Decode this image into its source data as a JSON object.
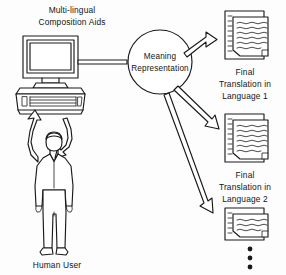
{
  "diagram": {
    "background_color": "#fdfdfd",
    "ink_color": "#1a1a1a"
  },
  "workstation": {
    "caption_line1": "Multi-lingual",
    "caption_line2": "Composition Aids",
    "icon_name": "desktop-computer-icon"
  },
  "user": {
    "caption": "Human User",
    "icon_name": "standing-person-icon"
  },
  "meaning_node": {
    "label_line1": "Meaning",
    "label_line2": "Representation",
    "shape": "circle"
  },
  "connector": {
    "name": "computer-to-meaning-link",
    "style": "double-line-bar"
  },
  "feedback_arrows": [
    {
      "name": "user-to-computer-arrow",
      "direction": "up"
    },
    {
      "name": "computer-to-user-arrow",
      "direction": "down"
    }
  ],
  "outputs": [
    {
      "id": "lang1",
      "caption_line1": "Final",
      "caption_line2": "Translation in",
      "caption_line3": "Language 1",
      "icon_name": "document-stack-icon"
    },
    {
      "id": "lang2",
      "caption_line1": "Final",
      "caption_line2": "Translation in",
      "caption_line3": "Language 2",
      "icon_name": "document-stack-icon"
    },
    {
      "id": "langN",
      "caption_line1": "",
      "caption_line2": "",
      "caption_line3": "",
      "icon_name": "document-stack-icon"
    }
  ],
  "continuation": {
    "name": "vertical-ellipsis",
    "dot_count": 3
  },
  "output_arrows": [
    {
      "name": "meaning-to-lang1-arrow"
    },
    {
      "name": "meaning-to-lang2-arrow"
    },
    {
      "name": "meaning-to-langn-arrow"
    }
  ]
}
